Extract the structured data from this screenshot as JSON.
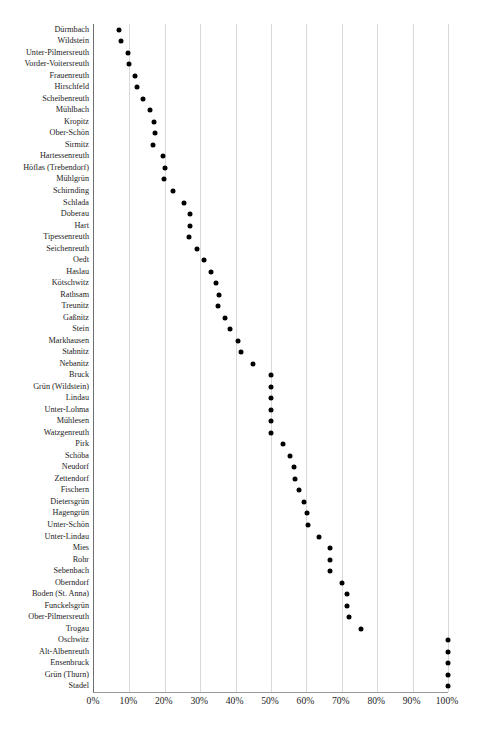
{
  "chart_data": {
    "type": "scatter",
    "title": "",
    "subtitle": "",
    "xlabel": "",
    "ylabel": "",
    "orientation": "horizontal-dot-plot",
    "grid": true,
    "legend": false,
    "xlim": [
      0,
      100
    ],
    "x_unit": "%",
    "xticks": [
      0,
      10,
      20,
      30,
      40,
      50,
      60,
      70,
      80,
      90,
      100
    ],
    "xtick_labels": [
      "0%",
      "10%",
      "20%",
      "30%",
      "40%",
      "50%",
      "60%",
      "70%",
      "80%",
      "90%",
      "100%"
    ],
    "categories": [
      "Dürmbach",
      "Wildstein",
      "Unter-Pilmersreuth",
      "Vorder-Voitersreuth",
      "Frauenreuth",
      "Hirschfeld",
      "Scheibenreuth",
      "Mühlbach",
      "Kropitz",
      "Ober-Schön",
      "Sirmitz",
      "Hartessenreuth",
      "Höflas (Trebendorf)",
      "Mühlgrün",
      "Schirnding",
      "Schlada",
      "Doberau",
      "Hart",
      "Tipessenreuth",
      "Seichenreuth",
      "Oedt",
      "Haslau",
      "Kötschwitz",
      "Rathsam",
      "Treunitz",
      "Gaßnitz",
      "Stein",
      "Markhausen",
      "Stabnitz",
      "Nebanitz",
      "Bruck",
      "Grün (Wildstein)",
      "Lindau",
      "Unter-Lohma",
      "Mühlesen",
      "Watzgenreuth",
      "Pirk",
      "Schöba",
      "Neudorf",
      "Zettendorf",
      "Fischern",
      "Dietersgrün",
      "Hagengrün",
      "Unter-Schön",
      "Unter-Lindau",
      "Mies",
      "Rohr",
      "Sebenbach",
      "Oberndorf",
      "Boden (St. Anna)",
      "Funckelsgrün",
      "Ober-Pilmersreuth",
      "Trogau",
      "Oschwitz",
      "Alt-Albenreuth",
      "Ensenbruck",
      "Grün (Thurn)",
      "Stadel"
    ],
    "values": [
      7.0,
      7.5,
      9.5,
      9.8,
      11.5,
      12.2,
      13.8,
      15.8,
      17.0,
      17.3,
      16.8,
      19.5,
      20.0,
      19.8,
      22.4,
      25.5,
      27.0,
      27.0,
      26.8,
      29.2,
      31.2,
      33.0,
      34.5,
      35.3,
      35.0,
      37.0,
      38.5,
      40.8,
      41.5,
      44.8,
      50.0,
      50.0,
      50.0,
      50.0,
      50.0,
      50.0,
      53.5,
      55.3,
      56.5,
      56.8,
      57.8,
      59.2,
      60.3,
      60.5,
      63.5,
      66.7,
      66.7,
      66.7,
      70.0,
      71.5,
      71.5,
      72.0,
      75.5,
      100.0,
      100.0,
      100.0,
      100.0,
      100.0
    ]
  },
  "style": {
    "dot_color": "#000000",
    "gridline_color": "#d9d9d9",
    "axis_color": "#6e6e6e",
    "background": "#ffffff"
  }
}
